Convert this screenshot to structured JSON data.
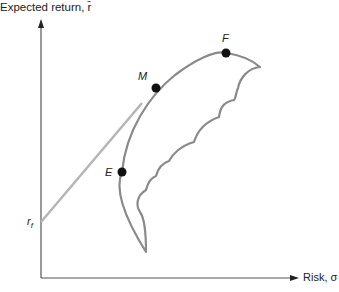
{
  "diagram": {
    "y_axis_label": "Expected return, r̄",
    "x_axis_label": "Risk, σ",
    "risk_free_label_main": "r",
    "risk_free_label_sub": "f",
    "points": [
      {
        "id": "F",
        "label": "F"
      },
      {
        "id": "M",
        "label": "M"
      },
      {
        "id": "E",
        "label": "E"
      }
    ],
    "colors": {
      "axis": "#555555",
      "frontier": "#8a8a8a",
      "capital_market_line": "#b5b5b5",
      "point": "#111111",
      "text": "#222222"
    }
  }
}
